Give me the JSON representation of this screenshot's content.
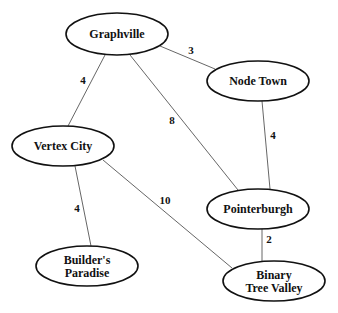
{
  "graph": {
    "nodes": [
      {
        "id": "graphville",
        "label_lines": [
          "Graphville"
        ],
        "cx": 117,
        "cy": 34,
        "rx": 51,
        "ry": 21
      },
      {
        "id": "node_town",
        "label_lines": [
          "Node Town"
        ],
        "cx": 258,
        "cy": 81,
        "rx": 51,
        "ry": 20
      },
      {
        "id": "vertex_city",
        "label_lines": [
          "Vertex City"
        ],
        "cx": 63,
        "cy": 146,
        "rx": 51,
        "ry": 20
      },
      {
        "id": "pointerburgh",
        "label_lines": [
          "Pointerburgh"
        ],
        "cx": 258,
        "cy": 209,
        "rx": 51,
        "ry": 20
      },
      {
        "id": "builders_paradise",
        "label_lines": [
          "Builder's",
          "Paradise"
        ],
        "cx": 87,
        "cy": 266,
        "rx": 51,
        "ry": 20
      },
      {
        "id": "binary_tree_valley",
        "label_lines": [
          "Binary",
          "Tree Valley"
        ],
        "cx": 274,
        "cy": 281,
        "rx": 51,
        "ry": 20
      }
    ],
    "edges": [
      {
        "from": "graphville",
        "to": "node_town",
        "weight": "3",
        "x1": 160,
        "y1": 46,
        "x2": 215,
        "y2": 69,
        "lx": 191,
        "ly": 54
      },
      {
        "from": "graphville",
        "to": "vertex_city",
        "weight": "4",
        "x1": 105,
        "y1": 55,
        "x2": 68,
        "y2": 126,
        "lx": 83,
        "ly": 84
      },
      {
        "from": "graphville",
        "to": "pointerburgh",
        "weight": "8",
        "x1": 130,
        "y1": 55,
        "x2": 238,
        "y2": 190,
        "lx": 172,
        "ly": 124
      },
      {
        "from": "node_town",
        "to": "pointerburgh",
        "weight": "4",
        "x1": 262,
        "y1": 101,
        "x2": 270,
        "y2": 189,
        "lx": 273,
        "ly": 139
      },
      {
        "from": "vertex_city",
        "to": "builders_paradise",
        "weight": "4",
        "x1": 75,
        "y1": 166,
        "x2": 91,
        "y2": 246,
        "lx": 77,
        "ly": 212
      },
      {
        "from": "vertex_city",
        "to": "binary_tree_valley",
        "weight": "10",
        "x1": 103,
        "y1": 160,
        "x2": 232,
        "y2": 268,
        "lx": 165,
        "ly": 204
      },
      {
        "from": "pointerburgh",
        "to": "binary_tree_valley",
        "weight": "2",
        "x1": 262,
        "y1": 229,
        "x2": 262,
        "y2": 261,
        "lx": 269,
        "ly": 243
      }
    ]
  }
}
